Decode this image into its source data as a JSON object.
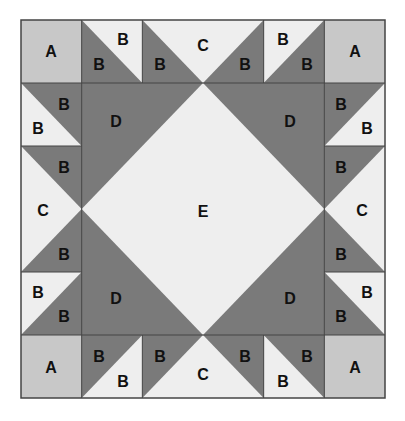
{
  "diagram": {
    "type": "quilt-block-template",
    "grid": {
      "cols": 6,
      "rows": 6,
      "x0": 21,
      "y0": 20,
      "cell_w": 60.67,
      "cell_h": 63
    },
    "colors": {
      "background": "#ffffff",
      "piece_a": "#c8c8c8",
      "piece_dark": "#7a7a7a",
      "piece_light": "#eeeeee",
      "outline": "#444444",
      "label": "#111111"
    },
    "labels": {
      "a": "A",
      "b": "B",
      "c": "C",
      "d": "D",
      "e": "E"
    },
    "pieces": [
      {
        "id": "a-top-left",
        "label": "A"
      },
      {
        "id": "a-top-right",
        "label": "A"
      },
      {
        "id": "a-bottom-left",
        "label": "A"
      },
      {
        "id": "a-bottom-right",
        "label": "A"
      },
      {
        "id": "c-top",
        "label": "C"
      },
      {
        "id": "c-bottom",
        "label": "C"
      },
      {
        "id": "c-left",
        "label": "C"
      },
      {
        "id": "c-right",
        "label": "C"
      },
      {
        "id": "d-top-left",
        "label": "D"
      },
      {
        "id": "d-top-right",
        "label": "D"
      },
      {
        "id": "d-bottom-left",
        "label": "D"
      },
      {
        "id": "d-bottom-right",
        "label": "D"
      },
      {
        "id": "e-center",
        "label": "E"
      }
    ]
  }
}
